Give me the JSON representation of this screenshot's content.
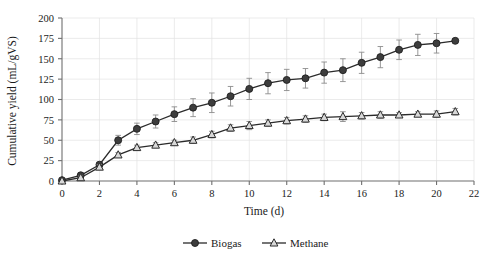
{
  "chart_data": {
    "type": "line",
    "title": "",
    "xlabel": "Time (d)",
    "ylabel": "Cumulative yield (mL/gVS)",
    "xlim": [
      0,
      22
    ],
    "ylim": [
      0,
      200
    ],
    "xticks": [
      0,
      2,
      4,
      6,
      8,
      10,
      12,
      14,
      16,
      18,
      20,
      22
    ],
    "yticks": [
      0,
      25,
      50,
      75,
      100,
      125,
      150,
      175,
      200
    ],
    "grid": true,
    "legend_position": "bottom",
    "x": [
      0,
      1,
      2,
      3,
      4,
      5,
      6,
      7,
      8,
      9,
      10,
      11,
      12,
      13,
      14,
      15,
      16,
      17,
      18,
      19,
      20,
      21
    ],
    "series": [
      {
        "name": "Biogas",
        "marker": "filled-circle",
        "values": [
          1,
          7,
          20,
          50,
          64,
          73,
          82,
          90,
          96,
          104,
          113,
          120,
          124,
          126,
          133,
          136,
          145,
          152,
          161,
          167,
          169,
          172
        ],
        "errors": [
          1,
          3,
          3,
          6,
          7,
          8,
          9,
          11,
          12,
          12,
          13,
          13,
          13,
          12,
          13,
          14,
          13,
          13,
          12,
          13,
          12,
          0
        ]
      },
      {
        "name": "Methane",
        "marker": "open-triangle",
        "values": [
          0,
          4,
          17,
          32,
          41,
          44,
          47,
          50,
          57,
          65,
          68,
          71,
          74,
          76,
          78,
          79,
          80,
          81,
          81,
          82,
          82,
          85
        ],
        "errors": [
          0,
          2,
          3,
          3,
          3,
          3,
          3,
          4,
          4,
          4,
          5,
          4,
          4,
          4,
          4,
          6,
          4,
          4,
          3,
          3,
          4,
          4
        ]
      }
    ]
  },
  "legend": {
    "items": [
      {
        "label": "Biogas"
      },
      {
        "label": "Methane"
      }
    ]
  }
}
